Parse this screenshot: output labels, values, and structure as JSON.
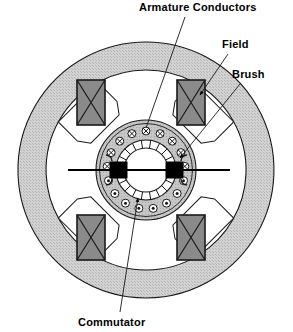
{
  "diagram": {
    "labels": [
      {
        "key": "armature_conductors",
        "text": "Armature Conductors",
        "x": 139,
        "y": 11,
        "anchor": "start"
      },
      {
        "key": "field",
        "text": "Field",
        "x": 222,
        "y": 48,
        "anchor": "start"
      },
      {
        "key": "brush",
        "text": "Brush",
        "x": 232,
        "y": 78,
        "anchor": "start"
      },
      {
        "key": "commutator",
        "text": "Commutator",
        "x": 78,
        "y": 326,
        "anchor": "start"
      }
    ],
    "leaders": [
      {
        "key": "leader-armature-conductors",
        "x1": 185,
        "y1": 17,
        "x2": 146,
        "y2": 128,
        "arrow": false
      },
      {
        "key": "leader-field",
        "x1": 228,
        "y1": 54,
        "x2": 200,
        "y2": 95,
        "arrow": true
      },
      {
        "key": "leader-brush",
        "x1": 240,
        "y1": 84,
        "x2": 180,
        "y2": 158,
        "arrow": true
      },
      {
        "key": "leader-commutator",
        "x1": 120,
        "y1": 312,
        "x2": 138,
        "y2": 198,
        "arrow": true
      }
    ],
    "geometry": {
      "center_x": 146,
      "center_y": 170,
      "yoke_outer_radius": 128,
      "yoke_inner_radius": 100,
      "armature_outer_radius": 50,
      "armature_inner_radius": 47,
      "conductor_ring_radius": 39,
      "conductor_count": 17,
      "conductor_symbol_top": "cross-in-circle",
      "conductor_symbol_bottom": "dot-in-circle",
      "commutator_outer_radius": 30,
      "commutator_inner_radius": 22,
      "commutator_segments": 20,
      "shaft_left_x": 68,
      "shaft_right_x": 230,
      "pole_angles_deg": [
        225,
        315,
        45,
        135
      ],
      "pole_count": 4,
      "brush_count": 2
    },
    "colors": {
      "background": "#ffffff",
      "yoke_fill": "#cfcfcf",
      "pole_shoe_fill": "#ffffff",
      "field_coil_fill": "#8a8a8a",
      "armature_fill": "#c2c2c2",
      "commutator_fill": "#ffffff",
      "brush_fill": "#000000",
      "outline": "#1a1a1a",
      "label_text": "#000000"
    }
  }
}
